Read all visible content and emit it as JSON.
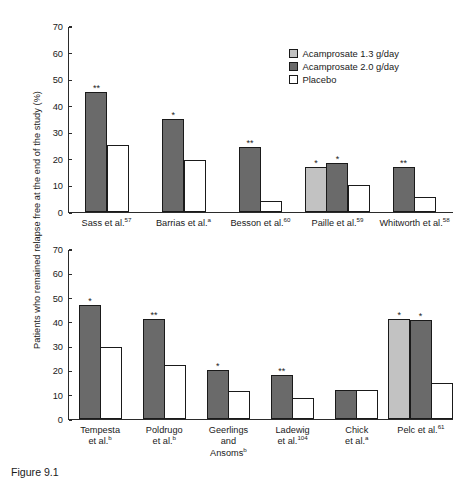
{
  "figure": {
    "caption": "Figure 9.1",
    "y_axis_title": "Patients who remained relapse free at the end of the study (%)"
  },
  "legend": {
    "position": "top-right",
    "items": [
      {
        "label": "Acamprosate 1.3 g/day",
        "color": "#c2c2c2",
        "series": "a"
      },
      {
        "label": "Acamprosate 2.0 g/day",
        "color": "#6a6a6a",
        "series": "b"
      },
      {
        "label": "Placebo",
        "color": "#ffffff",
        "series": "c"
      }
    ]
  },
  "chart_data": [
    {
      "type": "bar",
      "title": "",
      "panel": "top",
      "xlabel": "",
      "ylabel": "Patients who remained relapse free at the end of the study (%)",
      "ylim": [
        0,
        70
      ],
      "yticks": [
        0,
        10,
        20,
        30,
        40,
        50,
        60,
        70
      ],
      "grid": false,
      "categories": [
        "Sass et al.57",
        "Barrias et al.a",
        "Besson et al.60",
        "Paille et al.59",
        "Whitworth et al.58"
      ],
      "categories_rich": [
        {
          "text": "Sass et al.",
          "sup": "57"
        },
        {
          "text": "Barrias et al.",
          "sup": "a"
        },
        {
          "text": "Besson et al.",
          "sup": "60"
        },
        {
          "text": "Paille et al.",
          "sup": "59"
        },
        {
          "text": "Whitworth et al.",
          "sup": "58"
        }
      ],
      "series": [
        {
          "name": "Acamprosate 1.3 g/day",
          "color": "#c2c2c2",
          "values": [
            null,
            null,
            null,
            16.8,
            null
          ]
        },
        {
          "name": "Acamprosate 2.0 g/day",
          "color": "#6a6a6a",
          "values": [
            45.0,
            35.0,
            24.3,
            18.5,
            17.0
          ]
        },
        {
          "name": "Placebo",
          "color": "#ffffff",
          "values": [
            25.3,
            19.5,
            4.2,
            10.2,
            5.5
          ]
        }
      ],
      "significance": [
        {
          "category": "Sass et al.57",
          "series": "Acamprosate 2.0 g/day",
          "marker": "**"
        },
        {
          "category": "Barrias et al.a",
          "series": "Acamprosate 2.0 g/day",
          "marker": "*"
        },
        {
          "category": "Besson et al.60",
          "series": "Acamprosate 2.0 g/day",
          "marker": "**"
        },
        {
          "category": "Paille et al.59",
          "series": "Acamprosate 1.3 g/day",
          "marker": "*"
        },
        {
          "category": "Paille et al.59",
          "series": "Acamprosate 2.0 g/day",
          "marker": "*"
        },
        {
          "category": "Whitworth et al.58",
          "series": "Acamprosate 2.0 g/day",
          "marker": "**"
        }
      ]
    },
    {
      "type": "bar",
      "title": "",
      "panel": "bottom",
      "xlabel": "",
      "ylabel": "Patients who remained relapse free at the end of the study (%)",
      "ylim": [
        0,
        70
      ],
      "yticks": [
        0,
        10,
        20,
        30,
        40,
        50,
        60,
        70
      ],
      "grid": false,
      "categories": [
        "Tempesta et al.b",
        "Poldrugo et al.b",
        "Geerlings and Ansomsb",
        "Ladewig et al.104",
        "Chick et al.a",
        "Pelc et al.61"
      ],
      "categories_rich": [
        {
          "text": "Tempesta\net al.",
          "sup": "b"
        },
        {
          "text": "Poldrugo\net al.",
          "sup": "b"
        },
        {
          "text": "Geerlings\nand\nAnsoms",
          "sup": "b"
        },
        {
          "text": "Ladewig\net al.",
          "sup": "104"
        },
        {
          "text": "Chick\net al.",
          "sup": "a"
        },
        {
          "text": "Pelc et al.",
          "sup": "61"
        }
      ],
      "series": [
        {
          "name": "Acamprosate 1.3 g/day",
          "color": "#c2c2c2",
          "values": [
            null,
            null,
            null,
            null,
            null,
            41.0
          ]
        },
        {
          "name": "Acamprosate 2.0 g/day",
          "color": "#6a6a6a",
          "values": [
            47.0,
            41.0,
            20.2,
            18.0,
            12.0,
            40.8
          ]
        },
        {
          "name": "Placebo",
          "color": "#ffffff",
          "values": [
            29.7,
            22.3,
            11.4,
            8.7,
            12.0,
            15.0
          ]
        }
      ],
      "significance": [
        {
          "category": "Tempesta et al.b",
          "series": "Acamprosate 2.0 g/day",
          "marker": "*"
        },
        {
          "category": "Poldrugo et al.b",
          "series": "Acamprosate 2.0 g/day",
          "marker": "**"
        },
        {
          "category": "Geerlings and Ansomsb",
          "series": "Acamprosate 2.0 g/day",
          "marker": "*"
        },
        {
          "category": "Ladewig et al.104",
          "series": "Acamprosate 2.0 g/day",
          "marker": "**"
        },
        {
          "category": "Pelc et al.61",
          "series": "Acamprosate 1.3 g/day",
          "marker": "*"
        },
        {
          "category": "Pelc et al.61",
          "series": "Acamprosate 2.0 g/day",
          "marker": "*"
        }
      ]
    }
  ]
}
